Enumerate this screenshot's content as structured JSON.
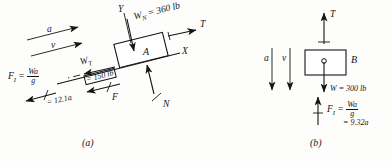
{
  "figure": {
    "ink_color": "#141414",
    "background_color": "#fdfdfb"
  },
  "panel_a": {
    "caption": "(a)",
    "block_label": "A",
    "axis_x": "X",
    "axis_y": "Y",
    "accel_label": "a",
    "velocity_label": "v",
    "tension_label": "T",
    "normal_label": "N",
    "friction_label": "F",
    "weight_normal": {
      "symbol": "W",
      "subscript": "N",
      "equals": "= 360 lb"
    },
    "weight_tangential": {
      "symbol": "W",
      "subscript": "T",
      "equals": "= 150 lb"
    },
    "inertia_force": {
      "symbol": "F",
      "subscript": "I",
      "equals": "=",
      "numerator": "Wa",
      "denominator": "g",
      "value": "= 12.1a"
    }
  },
  "panel_b": {
    "caption": "(b)",
    "block_label": "B",
    "accel_label": "a",
    "velocity_label": "v",
    "tension_label": "T",
    "weight": "W = 300 lb",
    "inertia_force": {
      "symbol": "F",
      "subscript": "I",
      "equals": "=",
      "numerator": "Wa",
      "denominator": "g",
      "value": "= 9.32a"
    }
  }
}
